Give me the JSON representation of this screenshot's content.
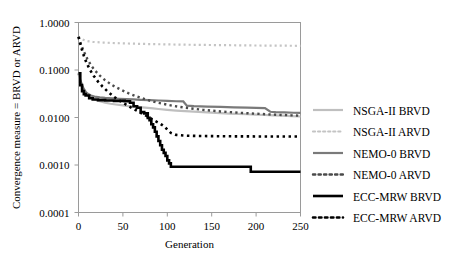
{
  "chart_data": {
    "type": "line",
    "title": "",
    "xlabel": "Generation",
    "ylabel": "Convergence measure = BRVD or ARVD",
    "xlim": [
      0,
      250
    ],
    "ylim": [
      0.0001,
      1.0
    ],
    "yscale": "log",
    "grid": false,
    "legend_position": "right",
    "xticks": [
      "0",
      "50",
      "100",
      "150",
      "200",
      "250"
    ],
    "xtick_values": [
      0,
      50,
      100,
      150,
      200,
      250
    ],
    "yticks": [
      "1.0000",
      "0.1000",
      "0.0100",
      "0.0010",
      "0.0001"
    ],
    "ytick_values": [
      1.0,
      0.1,
      0.01,
      0.001,
      0.0001
    ],
    "series": [
      {
        "name": "NSGA-II BRVD",
        "style": "solid",
        "color": "#bfbfbf",
        "width": 2.2,
        "x": [
          0,
          2,
          4,
          6,
          8,
          10,
          14,
          18,
          22,
          26,
          30,
          36,
          42,
          48,
          54,
          60,
          66,
          72,
          78,
          84,
          90,
          100,
          110,
          120,
          130,
          140,
          150,
          160,
          170,
          180,
          190,
          200,
          210,
          220,
          230,
          240,
          250
        ],
        "y": [
          0.085,
          0.06,
          0.046,
          0.038,
          0.033,
          0.03,
          0.026,
          0.024,
          0.0225,
          0.0215,
          0.0205,
          0.0195,
          0.0188,
          0.0182,
          0.0176,
          0.0172,
          0.0168,
          0.0163,
          0.0159,
          0.0155,
          0.0151,
          0.0145,
          0.014,
          0.0136,
          0.0133,
          0.013,
          0.0127,
          0.0124,
          0.0121,
          0.0119,
          0.0117,
          0.0115,
          0.0113,
          0.0111,
          0.0109,
          0.0107,
          0.0105
        ]
      },
      {
        "name": "NSGA-II ARVD",
        "style": "dotted",
        "color": "#c4c4c4",
        "width": 2.2,
        "x": [
          0,
          4,
          8,
          12,
          16,
          20,
          28,
          36,
          46,
          56,
          70,
          85,
          100,
          120,
          140,
          160,
          180,
          200,
          220,
          240,
          250
        ],
        "y": [
          0.5,
          0.44,
          0.415,
          0.4,
          0.392,
          0.386,
          0.378,
          0.372,
          0.366,
          0.361,
          0.355,
          0.35,
          0.346,
          0.341,
          0.337,
          0.334,
          0.331,
          0.328,
          0.326,
          0.324,
          0.323
        ]
      },
      {
        "name": "NEMO-0 BRVD",
        "style": "solid",
        "color": "#7a7a7a",
        "width": 2.2,
        "x": [
          0,
          2,
          4,
          6,
          8,
          10,
          14,
          18,
          24,
          30,
          38,
          46,
          54,
          62,
          70,
          80,
          90,
          100,
          110,
          118,
          122,
          130,
          145,
          160,
          175,
          190,
          200,
          210,
          216,
          222,
          232,
          242,
          250
        ],
        "y": [
          0.085,
          0.062,
          0.048,
          0.04,
          0.035,
          0.032,
          0.029,
          0.0275,
          0.0265,
          0.0258,
          0.0252,
          0.0248,
          0.0244,
          0.024,
          0.0236,
          0.0232,
          0.0228,
          0.0224,
          0.022,
          0.0218,
          0.0178,
          0.0174,
          0.017,
          0.0167,
          0.0164,
          0.0161,
          0.0159,
          0.0157,
          0.0132,
          0.013,
          0.0128,
          0.0126,
          0.0125
        ]
      },
      {
        "name": "NEMO-0 ARVD",
        "style": "dotted",
        "color": "#4a4a4a",
        "width": 2.4,
        "x": [
          0,
          3,
          6,
          10,
          14,
          18,
          24,
          30,
          38,
          46,
          56,
          66,
          78,
          90,
          105,
          120,
          140,
          160,
          180,
          200,
          220,
          240,
          250
        ],
        "y": [
          0.5,
          0.34,
          0.245,
          0.17,
          0.126,
          0.1,
          0.076,
          0.061,
          0.048,
          0.04,
          0.0325,
          0.0275,
          0.0232,
          0.0203,
          0.0178,
          0.0161,
          0.0145,
          0.0134,
          0.0126,
          0.012,
          0.0115,
          0.0111,
          0.0109
        ]
      },
      {
        "name": "ECC-MRW BRVD",
        "style": "solid",
        "color": "#000000",
        "width": 2.6,
        "steps": true,
        "x": [
          0,
          2,
          4,
          6,
          8,
          12,
          16,
          22,
          30,
          40,
          52,
          58,
          62,
          66,
          70,
          74,
          78,
          80,
          82,
          84,
          86,
          88,
          90,
          92,
          94,
          96,
          98,
          100,
          102,
          104,
          192,
          194,
          250
        ],
        "y": [
          0.085,
          0.048,
          0.036,
          0.031,
          0.029,
          0.0255,
          0.024,
          0.0232,
          0.0228,
          0.0224,
          0.022,
          0.0205,
          0.0172,
          0.016,
          0.013,
          0.0122,
          0.0098,
          0.0088,
          0.0072,
          0.0062,
          0.005,
          0.004,
          0.0032,
          0.0026,
          0.0021,
          0.0018,
          0.00155,
          0.00125,
          0.00108,
          0.00092,
          0.00092,
          0.00072,
          0.00072
        ]
      },
      {
        "name": "ECC-MRW ARVD",
        "style": "dotted",
        "color": "#000000",
        "width": 2.6,
        "x": [
          0,
          3,
          6,
          9,
          13,
          17,
          22,
          27,
          33,
          40,
          47,
          55,
          63,
          70,
          78,
          86,
          92,
          96,
          100,
          104,
          110,
          120,
          135,
          150,
          170,
          190,
          210,
          230,
          250
        ],
        "y": [
          0.5,
          0.3,
          0.2,
          0.142,
          0.1,
          0.076,
          0.057,
          0.045,
          0.035,
          0.0272,
          0.0222,
          0.018,
          0.0148,
          0.0126,
          0.0104,
          0.0085,
          0.0074,
          0.0066,
          0.0056,
          0.00475,
          0.0043,
          0.00415,
          0.00408,
          0.00405,
          0.00402,
          0.004,
          0.00399,
          0.00398,
          0.00397
        ]
      }
    ]
  },
  "legend": {
    "items": [
      {
        "label": "NSGA-II BRVD"
      },
      {
        "label": "NSGA-II ARVD"
      },
      {
        "label": "NEMO-0 BRVD"
      },
      {
        "label": "NEMO-0 ARVD"
      },
      {
        "label": "ECC-MRW BRVD"
      },
      {
        "label": "ECC-MRW ARVD"
      }
    ]
  }
}
